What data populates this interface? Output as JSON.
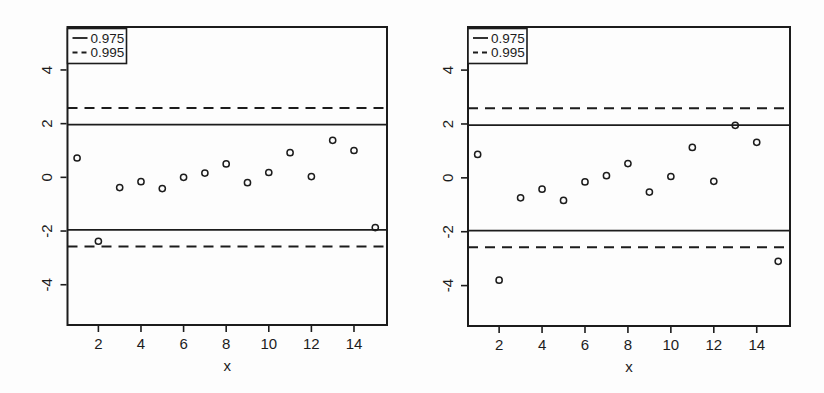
{
  "figure": {
    "background": "#fdfdfd",
    "ink_color": "#1c1c1c",
    "xlabel": "x"
  },
  "chart_data": [
    {
      "type": "scatter",
      "panel": "left",
      "title": "",
      "xlabel": "x",
      "ylabel": "",
      "xlim": [
        0.55,
        15.55
      ],
      "ylim": [
        -5.5,
        5.6
      ],
      "grid": false,
      "marker": "open-circle",
      "x_ticks": [
        2,
        4,
        6,
        8,
        10,
        12,
        14
      ],
      "y_ticks": [
        -4,
        -2,
        0,
        2,
        4
      ],
      "x": [
        1,
        2,
        3,
        4,
        5,
        6,
        7,
        8,
        9,
        10,
        11,
        12,
        13,
        14,
        15
      ],
      "y": [
        0.72,
        -2.38,
        -0.38,
        -0.16,
        -0.42,
        0.0,
        0.16,
        0.5,
        -0.2,
        0.18,
        0.92,
        0.03,
        1.38,
        1.0,
        -1.87
      ],
      "reference_lines": [
        {
          "y": 1.96,
          "style": "solid",
          "series": "0.975"
        },
        {
          "y": -1.96,
          "style": "solid",
          "series": "0.975"
        },
        {
          "y": 2.58,
          "style": "dashed",
          "series": "0.995"
        },
        {
          "y": -2.58,
          "style": "dashed",
          "series": "0.995"
        }
      ],
      "legend": {
        "position": "top-left",
        "entries": [
          {
            "label": "0.975",
            "line_style": "solid"
          },
          {
            "label": "0.995",
            "line_style": "dashed"
          }
        ]
      }
    },
    {
      "type": "scatter",
      "panel": "right",
      "title": "",
      "xlabel": "x",
      "ylabel": "",
      "xlim": [
        0.55,
        15.55
      ],
      "ylim": [
        -5.5,
        5.6
      ],
      "grid": false,
      "marker": "open-circle",
      "x_ticks": [
        2,
        4,
        6,
        8,
        10,
        12,
        14
      ],
      "y_ticks": [
        -4,
        -2,
        0,
        2,
        4
      ],
      "x": [
        1,
        2,
        3,
        4,
        5,
        6,
        7,
        8,
        9,
        10,
        11,
        12,
        13,
        14,
        15
      ],
      "y": [
        0.87,
        -3.8,
        -0.74,
        -0.42,
        -0.84,
        -0.15,
        0.08,
        0.53,
        -0.53,
        0.05,
        1.13,
        -0.13,
        1.95,
        1.32,
        -3.1
      ],
      "reference_lines": [
        {
          "y": 1.96,
          "style": "solid",
          "series": "0.975"
        },
        {
          "y": -1.96,
          "style": "solid",
          "series": "0.975"
        },
        {
          "y": 2.58,
          "style": "dashed",
          "series": "0.995"
        },
        {
          "y": -2.58,
          "style": "dashed",
          "series": "0.995"
        }
      ],
      "legend": {
        "position": "top-left",
        "entries": [
          {
            "label": "0.975",
            "line_style": "solid"
          },
          {
            "label": "0.995",
            "line_style": "dashed"
          }
        ]
      }
    }
  ]
}
